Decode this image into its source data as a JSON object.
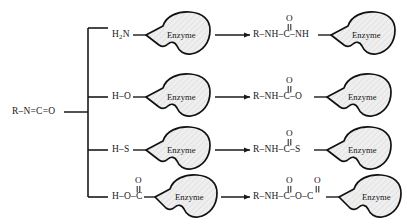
{
  "diagram": {
    "substrate": {
      "label": "R–N=C=O",
      "name": "isocyanate-substrate"
    },
    "colors": {
      "ink": "#1a1a1a",
      "enzyme_outline": "#111111",
      "enzyme_fill": "#ebebeb",
      "background": "#ffffff"
    },
    "enzyme_label": "Enzyme",
    "rows": [
      {
        "id": "amine",
        "reactant": "H₂N",
        "reactant_plain": "H2N",
        "reactant_carbonyl": "",
        "product_left": "R–NH–C–NH",
        "product_carbonyls": [
          "O"
        ],
        "product_full": "R–NH–C(=O)–NH–Enzyme",
        "arrow": "→"
      },
      {
        "id": "hydroxyl",
        "reactant": "H–O",
        "reactant_plain": "H-O",
        "reactant_carbonyl": "",
        "product_left": "R–NH–C–O",
        "product_carbonyls": [
          "O"
        ],
        "product_full": "R–NH–C(=O)–O–Enzyme",
        "arrow": "→"
      },
      {
        "id": "thiol",
        "reactant": "H–S",
        "reactant_plain": "H-S",
        "reactant_carbonyl": "",
        "product_left": "R–NH–C–S",
        "product_carbonyls": [
          "O"
        ],
        "product_full": "R–NH–C(=O)–S–Enzyme",
        "arrow": "→"
      },
      {
        "id": "carboxyl",
        "reactant": "H–O–C",
        "reactant_plain": "H-O-C",
        "reactant_carbonyl": "O",
        "product_left": "R–NH–C–O–C",
        "product_carbonyls": [
          "O",
          "O"
        ],
        "product_full": "R–NH–C(=O)–O–C(=O)–Enzyme",
        "arrow": "→"
      }
    ]
  }
}
